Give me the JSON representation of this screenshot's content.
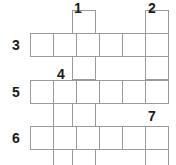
{
  "puzzle": {
    "type": "crossword-grid",
    "title": "",
    "grid": {
      "columns": 6,
      "rows": 6,
      "cell_size": 23,
      "origin_x": 30,
      "origin_y": 10,
      "border_color": "#9a9a9a",
      "cell_fill": "#ffffff"
    },
    "clue_numbers": [
      {
        "label": "1",
        "orientation": "down",
        "col": 2,
        "row": 0,
        "length": 6,
        "x": 74,
        "y": 1
      },
      {
        "label": "2",
        "orientation": "down",
        "col": 5,
        "row": 0,
        "length": 6,
        "x": 148,
        "y": 1
      },
      {
        "label": "3",
        "orientation": "across",
        "col": 0,
        "row": 1,
        "length": 6,
        "x": 12,
        "y": 38
      },
      {
        "label": "4",
        "orientation": "down",
        "col": 1,
        "row": 2,
        "length": 4,
        "x": 57,
        "y": 67
      },
      {
        "label": "5",
        "orientation": "across",
        "col": 0,
        "row": 3,
        "length": 6,
        "x": 12,
        "y": 85
      },
      {
        "label": "6",
        "orientation": "across",
        "col": 0,
        "row": 5,
        "length": 6,
        "x": 12,
        "y": 131
      },
      {
        "label": "7",
        "orientation": "down",
        "col": 5,
        "row": 5,
        "length": 2,
        "x": 148,
        "y": 109
      }
    ],
    "cells": [
      {
        "name": "cell-r0-c2",
        "x": 72,
        "y": 10,
        "w": 24,
        "h": 24
      },
      {
        "name": "cell-r0-c5",
        "x": 145,
        "y": 10,
        "w": 24,
        "h": 24
      },
      {
        "name": "cell-r1-c0",
        "x": 30,
        "y": 33,
        "w": 24,
        "h": 24
      },
      {
        "name": "cell-r1-c1",
        "x": 53,
        "y": 33,
        "w": 24,
        "h": 24
      },
      {
        "name": "cell-r1-c2",
        "x": 76,
        "y": 33,
        "w": 24,
        "h": 24
      },
      {
        "name": "cell-r1-c3",
        "x": 99,
        "y": 33,
        "w": 24,
        "h": 24
      },
      {
        "name": "cell-r1-c4",
        "x": 122,
        "y": 33,
        "w": 24,
        "h": 24
      },
      {
        "name": "cell-r1-c5",
        "x": 145,
        "y": 33,
        "w": 24,
        "h": 24
      },
      {
        "name": "cell-r2-c2",
        "x": 72,
        "y": 56,
        "w": 24,
        "h": 24
      },
      {
        "name": "cell-r2-c5",
        "x": 145,
        "y": 56,
        "w": 24,
        "h": 24
      },
      {
        "name": "cell-r3-c0",
        "x": 30,
        "y": 80,
        "w": 24,
        "h": 24
      },
      {
        "name": "cell-r3-c1",
        "x": 53,
        "y": 80,
        "w": 24,
        "h": 24
      },
      {
        "name": "cell-r3-c2",
        "x": 76,
        "y": 80,
        "w": 24,
        "h": 24
      },
      {
        "name": "cell-r3-c3",
        "x": 99,
        "y": 80,
        "w": 24,
        "h": 24
      },
      {
        "name": "cell-r3-c4",
        "x": 122,
        "y": 80,
        "w": 24,
        "h": 24
      },
      {
        "name": "cell-r3-c5",
        "x": 145,
        "y": 80,
        "w": 24,
        "h": 24
      },
      {
        "name": "cell-r4-c1",
        "x": 53,
        "y": 103,
        "w": 24,
        "h": 24
      },
      {
        "name": "cell-r4-c2",
        "x": 72,
        "y": 103,
        "w": 24,
        "h": 24
      },
      {
        "name": "cell-r5-c0",
        "x": 30,
        "y": 126,
        "w": 24,
        "h": 24
      },
      {
        "name": "cell-r5-c1",
        "x": 53,
        "y": 126,
        "w": 24,
        "h": 24
      },
      {
        "name": "cell-r5-c2",
        "x": 76,
        "y": 126,
        "w": 24,
        "h": 24
      },
      {
        "name": "cell-r5-c3",
        "x": 99,
        "y": 126,
        "w": 24,
        "h": 24
      },
      {
        "name": "cell-r5-c4",
        "x": 122,
        "y": 126,
        "w": 24,
        "h": 24
      },
      {
        "name": "cell-r5-c5",
        "x": 145,
        "y": 126,
        "w": 24,
        "h": 24
      },
      {
        "name": "cell-r6-c1",
        "x": 53,
        "y": 149,
        "w": 24,
        "h": 24
      },
      {
        "name": "cell-r6-c2",
        "x": 72,
        "y": 149,
        "w": 24,
        "h": 24
      },
      {
        "name": "cell-r6-c5",
        "x": 145,
        "y": 149,
        "w": 24,
        "h": 24
      }
    ]
  }
}
